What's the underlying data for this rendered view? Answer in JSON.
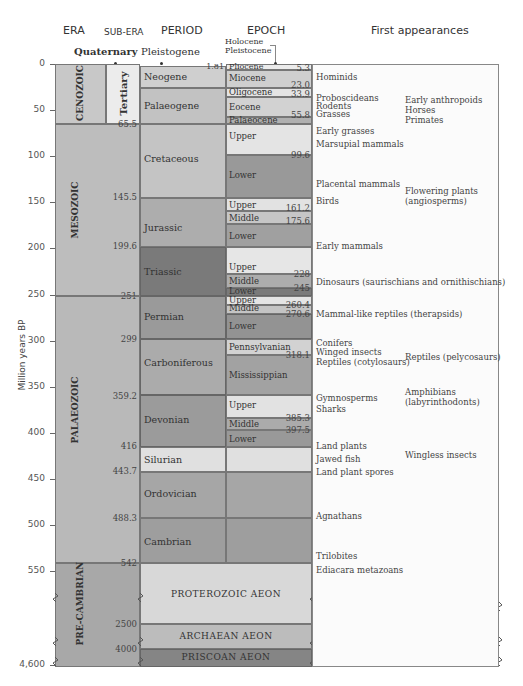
{
  "headers": {
    "era": "ERA",
    "sub_era": "SUB-ERA",
    "period": "PERIOD",
    "epoch": "EPOCH",
    "first_appearances": "First appearances"
  },
  "top_labels": {
    "quaternary": "Quaternary",
    "pleistogene": "Pleistogene",
    "holocene": "Holocene",
    "pleistocene": "Pleistocene"
  },
  "axis": {
    "label": "Million years BP",
    "ticks": [
      "0",
      "50",
      "100",
      "150",
      "200",
      "250",
      "300",
      "350",
      "400",
      "450",
      "500",
      "550",
      "4,600"
    ]
  },
  "eras": {
    "cenozoic": "CENOZOIC",
    "mesozoic": "MESOZOIC",
    "palaeozoic": "PALAEOZOIC",
    "precambrian": "PRE-CAMBRIAN"
  },
  "sub_era": {
    "tertiary": "Tertiary"
  },
  "boundaries": {
    "b1_81": "1.81",
    "b65_5": "65.5",
    "b145_5": "145.5",
    "b199_6": "199.6",
    "b251": "251",
    "b299": "299",
    "b359_2": "359.2",
    "b416": "416",
    "b443_7": "443.7",
    "b488_3": "488.3",
    "b542": "542",
    "b2500": "2500",
    "b4000": "4000"
  },
  "periods": {
    "neogene": "Neogene",
    "palaeogene": "Palaeogene",
    "cretaceous": "Cretaceous",
    "jurassic": "Jurassic",
    "triassic": "Triassic",
    "permian": "Permian",
    "carboniferous": "Carboniferous",
    "devonian": "Devonian",
    "silurian": "Silurian",
    "ordovician": "Ordovician",
    "cambrian": "Cambrian"
  },
  "epochs": {
    "pliocene": "Pliocene",
    "miocene": "Miocene",
    "oligocene": "Oligocene",
    "eocene": "Eocene",
    "palaeocene": "Palaeocene",
    "cret_upper": "Upper",
    "cret_lower": "Lower",
    "jur_upper": "Upper",
    "jur_middle": "Middle",
    "jur_lower": "Lower",
    "tri_upper": "Upper",
    "tri_middle": "Middle",
    "tri_lower": "Lower",
    "perm_upper": "Upper",
    "perm_middle": "Middle",
    "perm_lower": "Lower",
    "pennsylvanian": "Pennsylvanian",
    "mississippian": "Mississippian",
    "dev_upper": "Upper",
    "dev_middle": "Middle",
    "dev_lower": "Lower"
  },
  "epoch_values": {
    "v5_3": "5.3",
    "v23_0": "23.0",
    "v33_9": "33.9",
    "v55_8": "55.8",
    "v99_6": "99.6",
    "v161_2": "161.2",
    "v175_6": "175.6",
    "v228": "228",
    "v245": "245",
    "v260_4": "260.4",
    "v270_6": "270.6",
    "v318_1": "318.1",
    "v385_3": "385.3",
    "v397_5": "397.5"
  },
  "aeons": {
    "proterozoic": "PROTEROZOIC AEON",
    "archaean": "ARCHAEAN AEON",
    "priscoan": "PRISCOAN AEON"
  },
  "first_appearances": {
    "left": [
      "Hominids",
      "Proboscideans",
      "Rodents",
      "Grasses",
      "Early grasses",
      "Marsupial mammals",
      "Placental mammals",
      "Birds",
      "Early mammals",
      "Dinosaurs (saurischians and ornithischians)",
      "Mammal-like reptiles (therapsids)",
      "Conifers",
      "Winged insects",
      "Reptiles (cotylosaurs)",
      "Gymnosperms",
      "Sharks",
      "Land plants",
      "Jawed fish",
      "Land plant spores",
      "Agnathans",
      "Trilobites",
      "Ediacara metazoans"
    ],
    "right": [
      "Early anthropoids",
      "Horses",
      "Primates",
      "Flowering plants",
      "(angiosperms)",
      "Reptiles (pelycosaurs)",
      "Amphibians",
      "(labyrinthodonts)",
      "Wingless insects"
    ]
  }
}
